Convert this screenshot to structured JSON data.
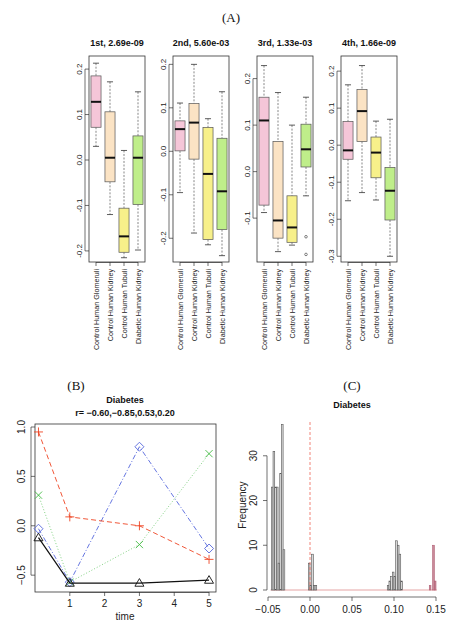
{
  "figure": {
    "label_a": "(A)",
    "label_b": "(B)",
    "label_c": "(C)"
  },
  "chart_data": [
    {
      "type": "boxplot",
      "panel": "A",
      "categories": [
        "Control Human Glomeruli",
        "Control Human Kidney",
        "Control Human Tubuli",
        "Diabetic Human Kidney"
      ],
      "colors": [
        "#f5c6d8",
        "#fbe3c4",
        "#f7f08a",
        "#bfee8a"
      ],
      "subplots": [
        {
          "title": "1st, 2.69e-09",
          "ylim": [
            -0.22,
            0.22
          ],
          "yticks": [
            -0.2,
            -0.1,
            0.0,
            0.1,
            0.2
          ],
          "ytick_labels": [
            "-0.2",
            "-0.1",
            "0.0",
            "0.1",
            "0.2"
          ],
          "boxes": [
            {
              "min": 0.03,
              "q1": 0.072,
              "median": 0.128,
              "q3": 0.185,
              "max": 0.213,
              "outliers": []
            },
            {
              "min": -0.12,
              "q1": -0.048,
              "median": 0.005,
              "q3": 0.106,
              "max": 0.172,
              "outliers": []
            },
            {
              "min": -0.215,
              "q1": -0.203,
              "median": -0.168,
              "q3": -0.106,
              "max": 0.021,
              "outliers": []
            },
            {
              "min": -0.198,
              "q1": -0.098,
              "median": 0.005,
              "q3": 0.053,
              "max": 0.15,
              "outliers": []
            }
          ]
        },
        {
          "title": "2nd, 5.60e-03",
          "ylim": [
            -0.25,
            0.21
          ],
          "yticks": [
            -0.2,
            -0.1,
            0.0,
            0.1,
            0.2
          ],
          "ytick_labels": [
            "-0.2",
            "-0.1",
            "0.0",
            "0.1",
            "0.2"
          ],
          "boxes": [
            {
              "min": -0.095,
              "q1": 0.001,
              "median": 0.051,
              "q3": 0.07,
              "max": 0.111,
              "outliers": []
            },
            {
              "min": -0.188,
              "q1": -0.018,
              "median": 0.066,
              "q3": 0.11,
              "max": 0.2,
              "outliers": []
            },
            {
              "min": -0.215,
              "q1": -0.203,
              "median": -0.052,
              "q3": 0.055,
              "max": 0.075,
              "outliers": []
            },
            {
              "min": -0.24,
              "q1": -0.18,
              "median": -0.092,
              "q3": 0.03,
              "max": 0.137,
              "outliers": []
            }
          ]
        },
        {
          "title": "3rd, 1.33e-03",
          "ylim": [
            -0.19,
            0.24
          ],
          "yticks": [
            -0.1,
            0.0,
            0.1,
            0.2
          ],
          "ytick_labels": [
            "-0.1",
            "0.0",
            "0.1",
            "0.2"
          ],
          "boxes": [
            {
              "min": -0.088,
              "q1": -0.072,
              "median": 0.11,
              "q3": 0.16,
              "max": 0.228,
              "outliers": []
            },
            {
              "min": -0.172,
              "q1": -0.143,
              "median": -0.105,
              "q3": 0.065,
              "max": 0.17,
              "outliers": []
            },
            {
              "min": -0.158,
              "q1": -0.152,
              "median": -0.12,
              "q3": -0.052,
              "max": 0.1,
              "outliers": []
            },
            {
              "min": -0.052,
              "q1": 0.01,
              "median": 0.048,
              "q3": 0.102,
              "max": 0.16,
              "outliers": [
                -0.14,
                -0.178
              ]
            }
          ]
        },
        {
          "title": "4th, 1.66e-09",
          "ylim": [
            -0.31,
            0.23
          ],
          "yticks": [
            -0.3,
            -0.2,
            -0.1,
            0.0,
            0.1,
            0.2
          ],
          "ytick_labels": [
            "-0.3",
            "-0.2",
            "-0.1",
            "0.0",
            "0.1",
            "0.2"
          ],
          "boxes": [
            {
              "min": -0.15,
              "q1": -0.038,
              "median": -0.014,
              "q3": 0.064,
              "max": 0.163,
              "outliers": []
            },
            {
              "min": -0.128,
              "q1": 0.01,
              "median": 0.092,
              "q3": 0.15,
              "max": 0.215,
              "outliers": []
            },
            {
              "min": -0.148,
              "q1": -0.088,
              "median": -0.02,
              "q3": 0.022,
              "max": 0.065,
              "outliers": []
            },
            {
              "min": -0.3,
              "q1": -0.202,
              "median": -0.123,
              "q3": -0.06,
              "max": 0.07,
              "outliers": []
            }
          ]
        }
      ]
    },
    {
      "type": "line",
      "panel": "B",
      "title": "Diabetes",
      "subtitle": "r= −0.60,−0.85,0.53,0.20",
      "xlabel": "time",
      "ylabel": "",
      "x": [
        0.1,
        1,
        3,
        5
      ],
      "xlim": [
        0,
        5.2
      ],
      "ylim": [
        -0.64,
        1.0
      ],
      "xticks": [
        1,
        2,
        3,
        4,
        5
      ],
      "yticks": [
        -0.5,
        0.0,
        0.5,
        1.0
      ],
      "ytick_labels": [
        "−0.5",
        "0.0",
        "0.5",
        "1.0"
      ],
      "series": [
        {
          "name": "series-1",
          "marker": "triangle",
          "color": "#111111",
          "dash": "",
          "values": [
            -0.12,
            -0.58,
            -0.58,
            -0.55
          ]
        },
        {
          "name": "series-2",
          "marker": "plus",
          "color": "#ee4422",
          "dash": "5,3",
          "values": [
            0.95,
            0.09,
            0.0,
            -0.34
          ]
        },
        {
          "name": "series-3",
          "marker": "x",
          "color": "#44bb44",
          "dash": "1,2",
          "values": [
            0.31,
            -0.57,
            -0.19,
            0.73
          ]
        },
        {
          "name": "series-4",
          "marker": "diamond",
          "color": "#5566dd",
          "dash": "5,2,1,2",
          "values": [
            -0.03,
            -0.57,
            0.8,
            -0.23
          ]
        }
      ]
    },
    {
      "type": "histogram",
      "panel": "C",
      "title": "Diabetes",
      "xlabel": "",
      "ylabel": "Frequency",
      "xlim": [
        -0.05,
        0.15
      ],
      "ylim": [
        0,
        38
      ],
      "xticks": [
        -0.05,
        0.0,
        0.05,
        0.1,
        0.15
      ],
      "xtick_labels": [
        "−0.05",
        "0.00",
        "0.05",
        "0.10",
        "0.15"
      ],
      "yticks": [
        0,
        10,
        20,
        30
      ],
      "vline": {
        "x": 0.0,
        "color": "#ee6655",
        "style": "dashed"
      },
      "bin_width": 0.002,
      "bins": [
        {
          "x": -0.045,
          "count": 23,
          "color": "#aaaaaa"
        },
        {
          "x": -0.043,
          "count": 31,
          "color": "#aaaaaa"
        },
        {
          "x": -0.041,
          "count": 23,
          "color": "#aaaaaa"
        },
        {
          "x": -0.039,
          "count": 23,
          "color": "#aaaaaa"
        },
        {
          "x": -0.037,
          "count": 6,
          "color": "#aaaaaa"
        },
        {
          "x": -0.035,
          "count": 26,
          "color": "#aaaaaa"
        },
        {
          "x": -0.033,
          "count": 37,
          "color": "#aaaaaa"
        },
        {
          "x": -0.031,
          "count": 9,
          "color": "#aaaaaa"
        },
        {
          "x": -0.001,
          "count": 6,
          "color": "#aaaaaa"
        },
        {
          "x": 0.001,
          "count": 1,
          "color": "#aaaaaa"
        },
        {
          "x": 0.003,
          "count": 8,
          "color": "#aaaaaa"
        },
        {
          "x": 0.005,
          "count": 1,
          "color": "#aaaaaa"
        },
        {
          "x": 0.007,
          "count": 1,
          "color": "#aaaaaa"
        },
        {
          "x": 0.093,
          "count": 1,
          "color": "#aaaaaa"
        },
        {
          "x": 0.095,
          "count": 2,
          "color": "#aaaaaa"
        },
        {
          "x": 0.097,
          "count": 3,
          "color": "#aaaaaa"
        },
        {
          "x": 0.099,
          "count": 4,
          "color": "#aaaaaa"
        },
        {
          "x": 0.101,
          "count": 3,
          "color": "#aaaaaa"
        },
        {
          "x": 0.103,
          "count": 11,
          "color": "#aaaaaa"
        },
        {
          "x": 0.105,
          "count": 10,
          "color": "#aaaaaa"
        },
        {
          "x": 0.107,
          "count": 8,
          "color": "#aaaaaa"
        },
        {
          "x": 0.109,
          "count": 2,
          "color": "#aaaaaa"
        },
        {
          "x": 0.143,
          "count": 1,
          "color": "#b05c72"
        },
        {
          "x": 0.147,
          "count": 10,
          "color": "#b05c72"
        },
        {
          "x": 0.149,
          "count": 2,
          "color": "#b05c72"
        }
      ]
    }
  ]
}
